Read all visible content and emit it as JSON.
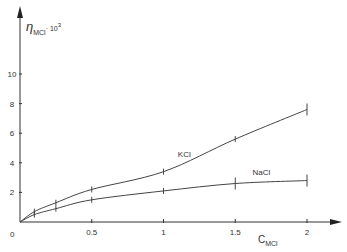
{
  "chart_data": {
    "type": "line",
    "title": "",
    "xlabel": "C_MCl",
    "xlabel_main": "C",
    "xlabel_sub": "MCl",
    "ylabel": "η_MCl · 10³",
    "ylabel_main": "η",
    "ylabel_sub": "MCl",
    "ylabel_suffix": "· 10",
    "ylabel_sup": "3",
    "x_ticks": [
      "0",
      "0.5",
      "1",
      "1.5",
      "2"
    ],
    "x_tick_values": [
      0,
      0.5,
      1,
      1.5,
      2
    ],
    "y_ticks": [
      "2",
      "4",
      "6",
      "8",
      "10"
    ],
    "y_tick_values": [
      2,
      4,
      6,
      8,
      10
    ],
    "origin_label": "0",
    "xlim": [
      0,
      2.2
    ],
    "ylim": [
      0,
      12
    ],
    "grid": false,
    "legend": "inline labels",
    "series": [
      {
        "name": "KCl",
        "x": [
          0,
          0.1,
          0.25,
          0.5,
          1,
          1.5,
          2
        ],
        "values": [
          0,
          0.7,
          1.3,
          2.2,
          3.4,
          5.6,
          7.6
        ],
        "label_pos": [
          1.1,
          4.4
        ]
      },
      {
        "name": "NaCl",
        "x": [
          0,
          0.1,
          0.25,
          0.5,
          1,
          1.5,
          2
        ],
        "values": [
          0,
          0.5,
          0.9,
          1.5,
          2.1,
          2.6,
          2.8
        ],
        "label_pos": [
          1.62,
          3.2
        ]
      }
    ]
  }
}
